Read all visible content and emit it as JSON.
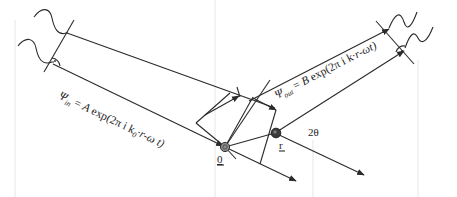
{
  "diagram": {
    "incident_wave": {
      "psi_symbol": "Ψ",
      "subscript": "in",
      "equals": "=",
      "amplitude": "A",
      "expression": "exp(2π i k",
      "k_subscript": "0",
      "tail": "·r-ω t)"
    },
    "scattered_wave": {
      "psi_symbol": "Ψ",
      "subscript": "out",
      "equals": "=",
      "amplitude": "B",
      "expression": "exp(2π i k",
      "tail": "·r-ωt)"
    },
    "points": {
      "origin_label": "0",
      "position_label": "r"
    },
    "angle_label": "2θ",
    "colors": {
      "line": "#2a2a2a",
      "text": "#1e1e1e",
      "background": "#ffffff",
      "scatterer_fill": "#7a7a7a",
      "scatterer_dark": "#3a3a3a"
    }
  }
}
